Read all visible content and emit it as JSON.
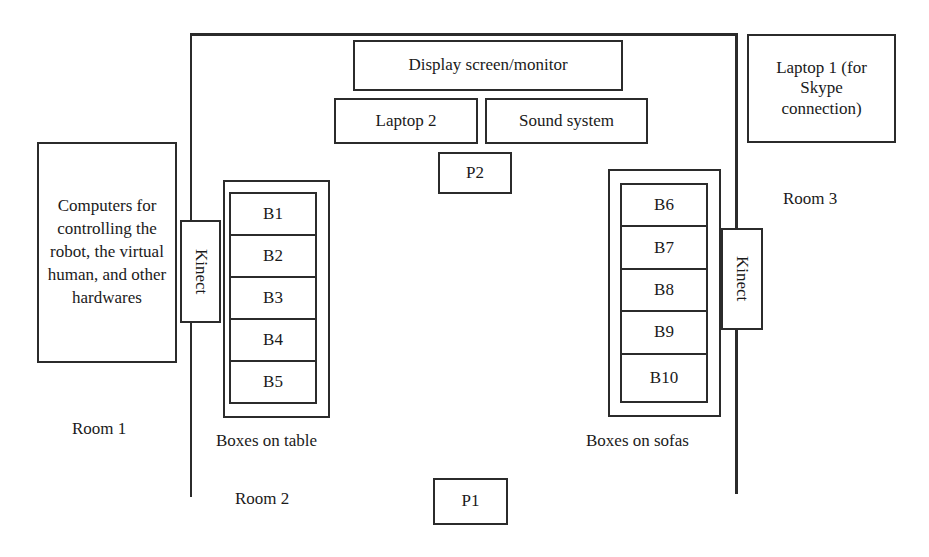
{
  "diagram": {
    "type": "floor-plan",
    "rooms": [
      {
        "id": "room1",
        "label": "Room 1"
      },
      {
        "id": "room2",
        "label": "Room 2"
      },
      {
        "id": "room3",
        "label": "Room 3"
      }
    ],
    "devices": {
      "display": "Display screen/monitor",
      "laptop2": "Laptop 2",
      "sound": "Sound system",
      "laptop1": "Laptop 1 (for Skype connection)",
      "computers": "Computers for controlling the robot, the virtual human, and other hardwares",
      "kinect_left": "Kinect",
      "kinect_right": "Kinect"
    },
    "positions": {
      "p1": "P1",
      "p2": "P2"
    },
    "table": {
      "caption": "Boxes on table",
      "boxes": [
        "B1",
        "B2",
        "B3",
        "B4",
        "B5"
      ]
    },
    "sofas": {
      "caption": "Boxes on sofas",
      "boxes": [
        "B6",
        "B7",
        "B8",
        "B9",
        "B10"
      ]
    }
  },
  "colors": {
    "stroke": "#2b2b2b",
    "background": "#ffffff",
    "text": "#1a1a1a"
  }
}
